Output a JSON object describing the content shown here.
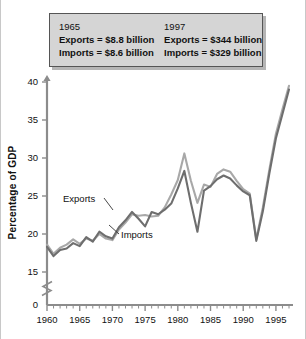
{
  "fact_box": {
    "columns": [
      {
        "year": "1965",
        "exports": "Exports = $8.8 billion",
        "imports": "Imports = $8.6 billion"
      },
      {
        "year": "1997",
        "exports": "Exports = $344 billion",
        "imports": "Imports = $329 billion"
      }
    ]
  },
  "axis": {
    "ylabel": "Percentage of GDP",
    "ytick_labels": [
      "0",
      "15",
      "20",
      "25",
      "30",
      "35",
      "40"
    ],
    "xtick_labels": [
      "1960",
      "1965",
      "1970",
      "1975",
      "1980",
      "1985",
      "1990",
      "1995"
    ]
  },
  "annotations": {
    "exports": "Exports",
    "imports": "Imports"
  },
  "colors": {
    "exports_line": "#a8a8a8",
    "imports_line": "#6e6e6e",
    "axis": "#8c8c8c",
    "box_fill": "#d5d5d5",
    "box_border": "#555555",
    "background": "#ffffff"
  },
  "chart_data": {
    "type": "line",
    "title": "",
    "xlabel": "",
    "ylabel": "Percentage of GDP",
    "xlim": [
      1960,
      1997
    ],
    "ylim": [
      15,
      40
    ],
    "y_axis_break": true,
    "y_axis_break_between": [
      0,
      15
    ],
    "yticks": [
      0,
      15,
      20,
      25,
      30,
      35,
      40
    ],
    "xticks": [
      1960,
      1965,
      1970,
      1975,
      1980,
      1985,
      1990,
      1995
    ],
    "grid": false,
    "legend": "inline-annotations",
    "x": [
      1960,
      1961,
      1962,
      1963,
      1964,
      1965,
      1966,
      1967,
      1968,
      1969,
      1970,
      1971,
      1972,
      1973,
      1974,
      1975,
      1976,
      1977,
      1978,
      1979,
      1980,
      1981,
      1982,
      1983,
      1984,
      1985,
      1986,
      1987,
      1988,
      1989,
      1990,
      1991,
      1992,
      1993,
      1994,
      1995,
      1996,
      1997
    ],
    "series": [
      {
        "name": "Exports",
        "values": [
          18.6,
          17.4,
          18.2,
          18.6,
          19.3,
          18.7,
          19.4,
          19.1,
          20.0,
          19.4,
          19.2,
          20.6,
          21.5,
          22.6,
          22.4,
          22.5,
          22.3,
          22.4,
          23.5,
          25.2,
          27.1,
          30.6,
          27.0,
          24.1,
          26.5,
          26.2,
          27.9,
          28.5,
          28.2,
          27.0,
          25.9,
          25.3,
          19.3,
          23.5,
          28.5,
          33.2,
          36.4,
          39.5
        ]
      },
      {
        "name": "Imports",
        "values": [
          18.3,
          17.1,
          17.9,
          18.1,
          18.8,
          18.4,
          19.6,
          19.0,
          20.3,
          19.7,
          19.4,
          20.9,
          21.8,
          22.9,
          22.0,
          21.0,
          22.9,
          22.6,
          23.2,
          24.0,
          26.0,
          28.3,
          24.1,
          20.3,
          25.7,
          26.3,
          27.2,
          27.7,
          27.3,
          26.4,
          25.6,
          25.1,
          19.1,
          23.0,
          28.0,
          32.6,
          35.8,
          39.0
        ]
      }
    ]
  }
}
